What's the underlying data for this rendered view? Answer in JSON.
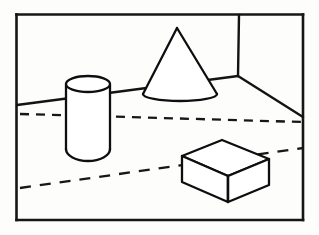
{
  "image": {
    "kind": "line-drawing",
    "title": "Perspective line drawing of three solids in a room interior",
    "width": 319,
    "height": 235,
    "background_color": "#fdfdfc",
    "ink_color": "#111111"
  },
  "frame": {
    "name": "picture-frame-border",
    "x": 16,
    "y": 14,
    "width": 287,
    "height": 206,
    "stroke_width": 2.6
  },
  "room": {
    "name": "room-interior",
    "back_wall_label": "back wall",
    "left_wall_label": "left wall",
    "right_wall_label": "right wall",
    "floor_label": "floor",
    "corner_vertex": {
      "x": 238,
      "y": 76
    },
    "corner_post": {
      "x1": 239,
      "y1": 15,
      "x2": 238,
      "y2": 76
    },
    "left_floor_line": {
      "x1": 17,
      "y1": 105,
      "x2": 238,
      "y2": 76
    },
    "right_floor_line": {
      "x1": 238,
      "y1": 76,
      "x2": 303,
      "y2": 117
    }
  },
  "dashed_lines": [
    {
      "name": "upper-dashed-line",
      "x1": 20,
      "y1": 114,
      "x2": 303,
      "y2": 122,
      "dash_pattern": "9 7"
    },
    {
      "name": "lower-dashed-line",
      "x1": 20,
      "y1": 188,
      "x2": 303,
      "y2": 148,
      "dash_pattern": "11 9"
    }
  ],
  "objects": [
    {
      "name": "cylinder",
      "shape": "cylinder",
      "center_x": 88,
      "top_ellipse": {
        "cx": 88,
        "cy": 84,
        "rx": 22,
        "ry": 8
      },
      "left_x": 66,
      "right_x": 110,
      "top_y": 84,
      "bottom_y": 155,
      "bottom_curve_depth": 8
    },
    {
      "name": "cone",
      "shape": "cone",
      "apex": {
        "x": 177,
        "y": 28
      },
      "base_ellipse": {
        "cx": 180,
        "cy": 94,
        "rx": 37,
        "ry": 7
      }
    },
    {
      "name": "box",
      "shape": "cuboid",
      "top_face": [
        {
          "x": 182,
          "y": 156
        },
        {
          "x": 222,
          "y": 140
        },
        {
          "x": 269,
          "y": 159
        },
        {
          "x": 228,
          "y": 176
        }
      ],
      "height": 26,
      "front_left_bottom": {
        "x": 182,
        "y": 182
      },
      "front_mid_bottom": {
        "x": 228,
        "y": 202
      },
      "front_right_bottom": {
        "x": 269,
        "y": 185
      }
    }
  ]
}
